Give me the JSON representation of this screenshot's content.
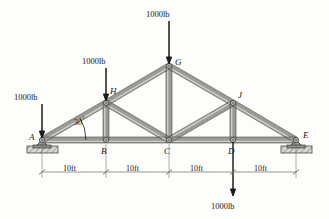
{
  "figure": {
    "type": "statics-truss-diagram",
    "background_color": "#fdfdfb",
    "member_color": "#9a9a96",
    "member_edge_color": "#4a4a48",
    "ink_color": "#1a1a1a"
  },
  "joints": [
    {
      "id": "A",
      "label": "A",
      "x": 42,
      "y": 140,
      "support": "pin"
    },
    {
      "id": "B",
      "label": "B",
      "x": 106,
      "y": 140,
      "support": "none"
    },
    {
      "id": "C",
      "label": "C",
      "x": 169,
      "y": 140,
      "support": "none"
    },
    {
      "id": "D",
      "label": "D",
      "x": 233,
      "y": 140,
      "support": "none"
    },
    {
      "id": "E",
      "label": "E",
      "x": 296,
      "y": 140,
      "support": "pin"
    },
    {
      "id": "H",
      "label": "H",
      "x": 106,
      "y": 103,
      "support": "none"
    },
    {
      "id": "G",
      "label": "G",
      "x": 169,
      "y": 66,
      "support": "none"
    },
    {
      "id": "J",
      "label": "J",
      "x": 233,
      "y": 103,
      "support": "none"
    }
  ],
  "members": [
    {
      "from": "A",
      "to": "H"
    },
    {
      "from": "H",
      "to": "G"
    },
    {
      "from": "G",
      "to": "J"
    },
    {
      "from": "J",
      "to": "E"
    },
    {
      "from": "A",
      "to": "B"
    },
    {
      "from": "B",
      "to": "C"
    },
    {
      "from": "C",
      "to": "D"
    },
    {
      "from": "D",
      "to": "E"
    },
    {
      "from": "H",
      "to": "B"
    },
    {
      "from": "G",
      "to": "C"
    },
    {
      "from": "J",
      "to": "D"
    },
    {
      "from": "H",
      "to": "C"
    },
    {
      "from": "J",
      "to": "C"
    }
  ],
  "loads": [
    {
      "id": "load-A",
      "label": "1000lb",
      "at": "A",
      "direction": "down",
      "label_x": 14,
      "label_y": 93,
      "tail_x": 42,
      "tail_y": 104,
      "head_x": 42,
      "head_y": 138
    },
    {
      "id": "load-H",
      "label": "1000lb",
      "at": "H",
      "direction": "down",
      "label_x": 82,
      "label_y": 57,
      "tail_x": 106,
      "tail_y": 68,
      "head_x": 106,
      "head_y": 101
    },
    {
      "id": "load-G",
      "label": "1000lb",
      "at": "G",
      "direction": "down",
      "label_x": 146,
      "label_y": 10,
      "tail_x": 169,
      "tail_y": 21,
      "head_x": 169,
      "head_y": 64
    },
    {
      "id": "load-D",
      "label": "1000lb",
      "at": "D",
      "direction": "down",
      "label_x": 211,
      "label_y": 202,
      "tail_x": 233,
      "tail_y": 142,
      "head_x": 233,
      "head_y": 196
    }
  ],
  "angle": {
    "label": "30",
    "unit": "°",
    "value_deg": 30,
    "at_joint": "A",
    "between": [
      "A-H chord",
      "A-B bottom chord"
    ],
    "label_x": 74,
    "label_y": 116
  },
  "dimensions": {
    "line_y": 172,
    "segments": [
      {
        "label": "10ft",
        "from": "A",
        "to": "B",
        "x1": 42,
        "x2": 106,
        "label_x": 63,
        "label_y": 165
      },
      {
        "label": "10ft",
        "from": "B",
        "to": "C",
        "x1": 106,
        "x2": 169,
        "label_x": 126,
        "label_y": 165
      },
      {
        "label": "10ft",
        "from": "C",
        "to": "D",
        "x1": 169,
        "x2": 233,
        "label_x": 190,
        "label_y": 165
      },
      {
        "label": "10ft",
        "from": "D",
        "to": "E",
        "x1": 233,
        "x2": 296,
        "label_x": 254,
        "label_y": 165
      }
    ]
  },
  "joint_label_positions": [
    {
      "id": "A",
      "x": 29,
      "y": 133
    },
    {
      "id": "B",
      "x": 101,
      "y": 147
    },
    {
      "id": "C",
      "x": 164,
      "y": 147
    },
    {
      "id": "D",
      "x": 228,
      "y": 147
    },
    {
      "id": "E",
      "x": 303,
      "y": 131
    },
    {
      "id": "H",
      "x": 110,
      "y": 87
    },
    {
      "id": "G",
      "x": 175,
      "y": 58
    },
    {
      "id": "J",
      "x": 238,
      "y": 91
    }
  ]
}
